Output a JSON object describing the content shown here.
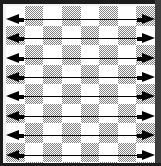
{
  "figure": {
    "frame_color": "#1c1c1c",
    "board_background": "#ffffff",
    "checker_fill": "#808080",
    "arrow_color": "#000000"
  },
  "chart_data": {
    "type": "heatmap",
    "title": "",
    "xlabel": "",
    "ylabel": "",
    "columns": 8,
    "rows": 9,
    "grid": false,
    "legend": "none",
    "cell_states": [
      "light",
      "dark"
    ],
    "pattern": "checkerboard",
    "matrix": [
      [
        "light",
        "dark",
        "light",
        "dark",
        "light",
        "dark",
        "light",
        "dark"
      ],
      [
        "dark",
        "light",
        "dark",
        "light",
        "dark",
        "light",
        "dark",
        "light"
      ],
      [
        "light",
        "dark",
        "light",
        "dark",
        "light",
        "dark",
        "light",
        "dark"
      ],
      [
        "dark",
        "light",
        "dark",
        "light",
        "dark",
        "light",
        "dark",
        "light"
      ],
      [
        "light",
        "dark",
        "light",
        "dark",
        "light",
        "dark",
        "light",
        "dark"
      ],
      [
        "dark",
        "light",
        "dark",
        "light",
        "dark",
        "light",
        "dark",
        "light"
      ],
      [
        "light",
        "dark",
        "light",
        "dark",
        "light",
        "dark",
        "light",
        "dark"
      ],
      [
        "dark",
        "light",
        "dark",
        "light",
        "dark",
        "light",
        "dark",
        "light"
      ],
      [
        "light",
        "dark",
        "light",
        "dark",
        "light",
        "dark",
        "light",
        "dark"
      ]
    ],
    "annotations": {
      "type": "double-headed-arrow",
      "count": 8,
      "orientation": "horizontal",
      "left_head": "◀",
      "right_head": "▶",
      "row_tops": [
        8,
        27,
        47,
        66,
        85,
        105,
        124,
        144
      ],
      "labels": [
        "",
        "",
        "",
        "",
        "",
        "",
        "",
        ""
      ]
    }
  }
}
